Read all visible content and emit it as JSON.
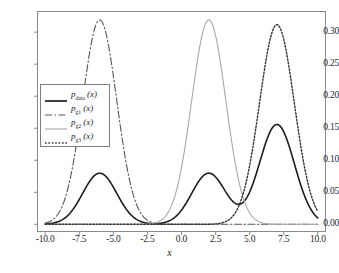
{
  "figure": {
    "caption": "",
    "xlabel": "x"
  },
  "axes": {
    "xticks": [
      "-10.0",
      "-7.5",
      "-5.0",
      "-2.5",
      "0.0",
      "2.5",
      "5.0",
      "7.5",
      "10.0"
    ],
    "yticks": [
      "0.00",
      "0.05",
      "0.10",
      "0.15",
      "0.20",
      "0.25",
      "0.30"
    ],
    "xlim": [
      -10.6,
      10.6
    ],
    "ylim": [
      -0.012,
      0.333
    ]
  },
  "legend": {
    "entries": [
      {
        "name": "p",
        "sub": "data",
        "suffix": "(x)",
        "style": "solid-thick",
        "color": "#1c1c1c"
      },
      {
        "name": "p",
        "sub": "g1",
        "suffix": "(x)",
        "style": "dash-dot",
        "color": "#555555"
      },
      {
        "name": "p",
        "sub": "g2",
        "suffix": "(x)",
        "style": "solid-thin",
        "color": "#a8a8a8"
      },
      {
        "name": "p",
        "sub": "g3",
        "suffix": "(x)",
        "style": "dotted",
        "color": "#333333"
      }
    ]
  },
  "chart_data": {
    "type": "line",
    "title": "",
    "xlabel": "x",
    "ylabel": "",
    "xlim": [
      -10.6,
      10.6
    ],
    "ylim": [
      -0.012,
      0.333
    ],
    "grid": false,
    "legend_position": "upper-left-inside",
    "series": [
      {
        "name": "p_data(x)",
        "style": "solid-thick",
        "color": "#1c1c1c",
        "linewidth": 1.6,
        "description": "mixture density with three modes",
        "components": [
          {
            "weight": 0.25,
            "mean": -6.0,
            "sigma": 1.25,
            "peak": 0.078
          },
          {
            "weight": 0.25,
            "mean": 2.0,
            "sigma": 1.25,
            "peak": 0.078
          },
          {
            "weight": 0.5,
            "mean": 7.0,
            "sigma": 1.28,
            "peak": 0.156
          }
        ],
        "peaks": [
          {
            "x": -6.0,
            "y": 0.078
          },
          {
            "x": 2.0,
            "y": 0.078
          },
          {
            "x": 7.0,
            "y": 0.156
          }
        ]
      },
      {
        "name": "p_g1(x)",
        "style": "dash-dot",
        "color": "#555555",
        "linewidth": 1.1,
        "mean": -6.0,
        "sigma": 1.25,
        "peaks": [
          {
            "x": -6.0,
            "y": 0.317
          }
        ]
      },
      {
        "name": "p_g2(x)",
        "style": "solid-thin",
        "color": "#a8a8a8",
        "linewidth": 1.1,
        "mean": 2.0,
        "sigma": 1.25,
        "peaks": [
          {
            "x": 2.0,
            "y": 0.318
          }
        ]
      },
      {
        "name": "p_g3(x)",
        "style": "dotted",
        "color": "#333333",
        "linewidth": 1.4,
        "mean": 7.0,
        "sigma": 1.28,
        "peaks": [
          {
            "x": 7.0,
            "y": 0.312
          }
        ]
      }
    ]
  }
}
